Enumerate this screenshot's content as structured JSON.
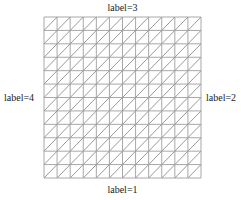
{
  "diagram": {
    "type": "triangular-mesh",
    "grid": {
      "cells_x": 12,
      "cells_y": 12,
      "diagonal_direction": "bottom-left-to-top-right"
    },
    "boundary_labels": {
      "top": "label=3",
      "bottom": "label=1",
      "left": "label=4",
      "right": "label=2"
    },
    "colors": {
      "grid_line": "#a8a8a8",
      "diagonal_line": "#9a9a9a",
      "label_text": "#222222",
      "background": "#ffffff"
    }
  }
}
